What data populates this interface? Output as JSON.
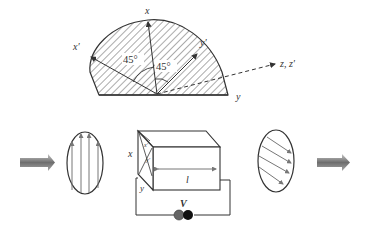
{
  "figure": {
    "top_panel": {
      "axis_labels": {
        "x": "x",
        "x_prime": "x′",
        "y": "y",
        "y_prime": "y′",
        "z": "z, z′"
      },
      "angle_labels": [
        "45°",
        "45°"
      ]
    },
    "bottom_panel": {
      "crystal_labels": {
        "x": "x",
        "y": "y",
        "length": "l",
        "face_x_prime": "x′",
        "face_y_prime": "y′"
      },
      "voltage_label": "V"
    },
    "colors": {
      "line": "#333333",
      "hatch": "#444444",
      "arrow_gray_dark": "#6e6e6e",
      "arrow_gray_light": "#c8c8c8",
      "field_arrow": "#7a7a7a",
      "battery_left": "#666666",
      "battery_right": "#111111"
    }
  }
}
